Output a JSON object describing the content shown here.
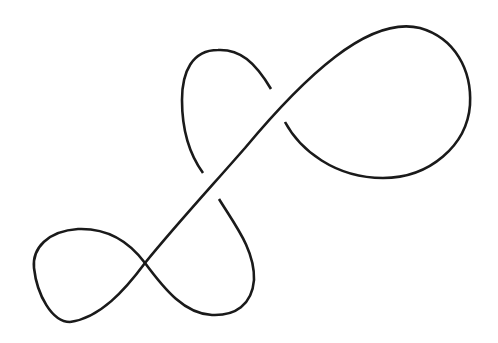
{
  "diagram": {
    "type": "knot-diagram",
    "stroke_color": "#1a1a1a",
    "background": "#ffffff",
    "crossings": 3,
    "components": [
      {
        "name": "top-right-loop"
      },
      {
        "name": "upper-small-loop"
      },
      {
        "name": "lower-loop"
      },
      {
        "name": "bottom-left-loop"
      },
      {
        "name": "main-diagonal-strand"
      }
    ]
  }
}
